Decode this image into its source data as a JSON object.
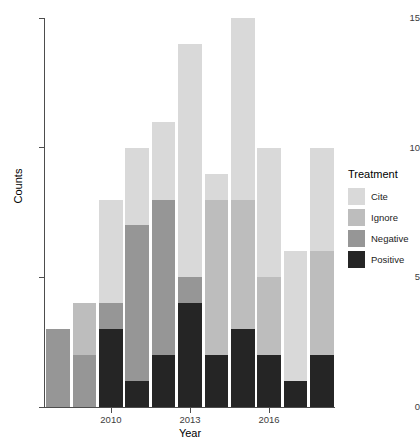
{
  "chart_data": {
    "type": "bar",
    "title": "",
    "xlabel": "Year",
    "ylabel": "Counts",
    "stacked": true,
    "grid": false,
    "legend_position": "right",
    "ylim": [
      0,
      15
    ],
    "yticks": [
      0,
      5,
      10,
      15
    ],
    "ytick_labels": [
      "0",
      "5",
      "10",
      "15"
    ],
    "xticks": [
      2010,
      2013,
      2016
    ],
    "xtick_labels": [
      "2010",
      "2013",
      "2016"
    ],
    "categories": [
      2008,
      2009,
      2010,
      2011,
      2012,
      2013,
      2014,
      2015,
      2016,
      2017,
      2018
    ],
    "series": [
      {
        "name": "Cite",
        "color": "#d9d9d9",
        "values": [
          0,
          0,
          4,
          3,
          3,
          9,
          1,
          7,
          5,
          5,
          4
        ]
      },
      {
        "name": "Ignore",
        "color": "#bdbdbd",
        "values": [
          0,
          2,
          0,
          0,
          0,
          0,
          6,
          5,
          3,
          0,
          4
        ]
      },
      {
        "name": "Negative",
        "color": "#969696",
        "values": [
          3,
          2,
          1,
          6,
          6,
          1,
          0,
          0,
          0,
          0,
          0
        ]
      },
      {
        "name": "Positive",
        "color": "#252525",
        "values": [
          0,
          0,
          3,
          1,
          2,
          4,
          2,
          3,
          2,
          1,
          2
        ]
      }
    ],
    "totals": [
      3,
      4,
      8,
      10,
      11,
      14,
      9,
      15,
      10,
      6,
      10
    ]
  },
  "legend": {
    "title": "Treatment",
    "entries": [
      {
        "label": "Cite",
        "color": "#d9d9d9"
      },
      {
        "label": "Ignore",
        "color": "#bdbdbd"
      },
      {
        "label": "Negative",
        "color": "#969696"
      },
      {
        "label": "Positive",
        "color": "#252525"
      }
    ]
  },
  "axes": {
    "x_title": "Year",
    "y_title": "Counts"
  }
}
